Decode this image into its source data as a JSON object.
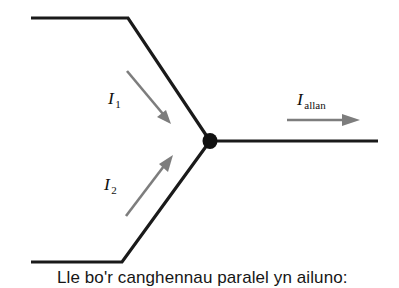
{
  "figure": {
    "name": "current-junction-diagram",
    "background_color": "#ffffff",
    "wire_color": "#1a1a1a",
    "arrow_color": "#7d7d7d",
    "junction_color": "#111111",
    "caption": "Lle bo'r canghennau paralel yn ailuno:",
    "labels": {
      "branch_one": {
        "symbol": "I",
        "subscript": "1"
      },
      "branch_two": {
        "symbol": "I",
        "subscript": "2"
      },
      "output": {
        "symbol": "I",
        "subscript": "allan"
      }
    },
    "wires": {
      "upper_branch": "M31,18 L128,18 L210,141",
      "lower_branch": "M31,262 L122,262 L210,141",
      "output_branch": "M210,141 L378,141"
    },
    "junction": {
      "cx": 210,
      "cy": 141,
      "rx": 7.5,
      "ry": 8
    },
    "flow_arrows": {
      "branch_one": {
        "x1": 127,
        "y1": 71,
        "x2": 168,
        "y2": 120
      },
      "branch_two": {
        "x1": 126,
        "y1": 216,
        "x2": 170,
        "y2": 158
      },
      "output": {
        "x1": 287,
        "y1": 120,
        "x2": 356,
        "y2": 120
      }
    },
    "label_positions": {
      "branch_one": {
        "x": 108,
        "y": 104
      },
      "branch_two": {
        "x": 104,
        "y": 190
      },
      "output": {
        "x": 297,
        "y": 105
      }
    },
    "caption_position": {
      "x": 57,
      "y": 283
    }
  }
}
